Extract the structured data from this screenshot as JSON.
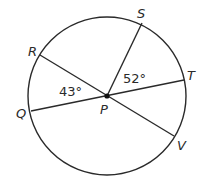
{
  "diagram": {
    "center": {
      "label": "P",
      "x": 107,
      "y": 96
    },
    "circle": {
      "cx": 107,
      "cy": 96,
      "r": 79
    },
    "stroke_color": "#2a2a2a",
    "points": {
      "R": {
        "label": "R",
        "x": 40,
        "y": 55
      },
      "S": {
        "label": "S",
        "x": 142,
        "y": 23
      },
      "T": {
        "label": "T",
        "x": 184,
        "y": 80
      },
      "Q": {
        "label": "Q",
        "x": 31,
        "y": 111
      },
      "V": {
        "label": "V",
        "x": 174,
        "y": 136
      }
    },
    "segments": [
      {
        "name": "diameter-RV",
        "from": "R",
        "to": "V"
      },
      {
        "name": "diameter-QT",
        "from": "Q",
        "to": "T"
      },
      {
        "name": "radius-PS",
        "from": "P",
        "to": "S"
      }
    ],
    "angles": {
      "RPQ": {
        "label": "43°"
      },
      "SPT": {
        "label": "52°"
      }
    }
  }
}
